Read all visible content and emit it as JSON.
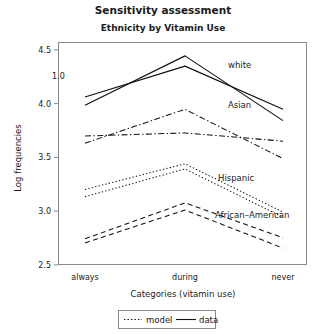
{
  "chart_data": {
    "type": "line",
    "title": "Sensitivity assessment",
    "subtitle": "Ethnicity by Vitamin Use",
    "xlabel": "Categories (vitamin use)",
    "ylabel": "Log frequencies",
    "categories": [
      "always",
      "during",
      "never"
    ],
    "ylim": [
      2.42,
      4.58
    ],
    "yticks": [
      "2.5",
      "3.0",
      "3.5",
      "4.0",
      "4.5"
    ],
    "ytick_values": [
      2.5,
      3.0,
      3.5,
      4.0,
      4.5
    ],
    "grid": false,
    "legend_position": "bottom-center",
    "annotation": "1.0",
    "series": [
      {
        "name": "white",
        "kind": "data",
        "style": "solid",
        "values": [
          3.97,
          4.45,
          3.82
        ]
      },
      {
        "name": "white",
        "kind": "model",
        "style": "solid",
        "values": [
          4.05,
          4.35,
          3.93
        ]
      },
      {
        "name": "Asian",
        "kind": "data",
        "style": "dashdot",
        "values": [
          3.6,
          3.93,
          3.45
        ]
      },
      {
        "name": "Asian",
        "kind": "model",
        "style": "dashdot",
        "values": [
          3.67,
          3.7,
          3.62
        ]
      },
      {
        "name": "Hispanic",
        "kind": "data",
        "style": "dotted",
        "values": [
          3.15,
          3.4,
          2.93
        ]
      },
      {
        "name": "Hispanic",
        "kind": "model",
        "style": "dotted",
        "values": [
          3.08,
          3.35,
          2.88
        ]
      },
      {
        "name": "African–American",
        "kind": "data",
        "style": "dashed",
        "values": [
          2.67,
          3.02,
          2.68
        ]
      },
      {
        "name": "African–American",
        "kind": "model",
        "style": "dashed",
        "values": [
          2.63,
          2.95,
          2.58
        ]
      }
    ],
    "series_labels": [
      {
        "text": "white",
        "x": 2.18,
        "y": 4.22
      },
      {
        "text": "Asian",
        "x": 2.02,
        "y": 3.85
      },
      {
        "text": "Hispanic",
        "x": 1.92,
        "y": 3.27
      },
      {
        "text": "African–American",
        "x": 1.9,
        "y": 2.93
      }
    ],
    "legend": [
      {
        "label": "model",
        "style": "dotted"
      },
      {
        "label": "data",
        "style": "solid"
      }
    ],
    "colors": {
      "line": "#111111",
      "frame": "#8a8a8a",
      "text": "#1a1a1a",
      "background": "#ffffff"
    }
  }
}
